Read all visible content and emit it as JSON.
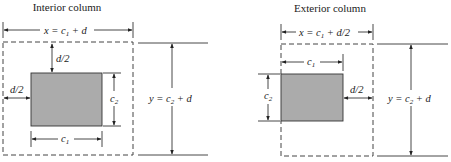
{
  "figure": {
    "interior": {
      "title": "Interior column",
      "x_label": "x = c",
      "x_sub": "1",
      "x_rest": " + d",
      "y_label": "y = c",
      "y_sub": "2",
      "y_rest": " + d",
      "d_half_top": "d/2",
      "d_half_left": "d/2",
      "c1_label": "c",
      "c1_sub": "1",
      "c2_label": "c",
      "c2_sub": "2"
    },
    "exterior": {
      "title": "Exterior column",
      "x_label": "x = c",
      "x_sub": "1",
      "x_rest": " + d/2",
      "y_label": "y = c",
      "y_sub": "2",
      "y_rest": " + d",
      "d_half_right": "d/2",
      "c1_label": "c",
      "c1_sub": "1",
      "c2_label": "c",
      "c2_sub": "2"
    },
    "colors": {
      "column_fill": "#ababab",
      "line": "#333333",
      "background": "#ffffff"
    }
  }
}
